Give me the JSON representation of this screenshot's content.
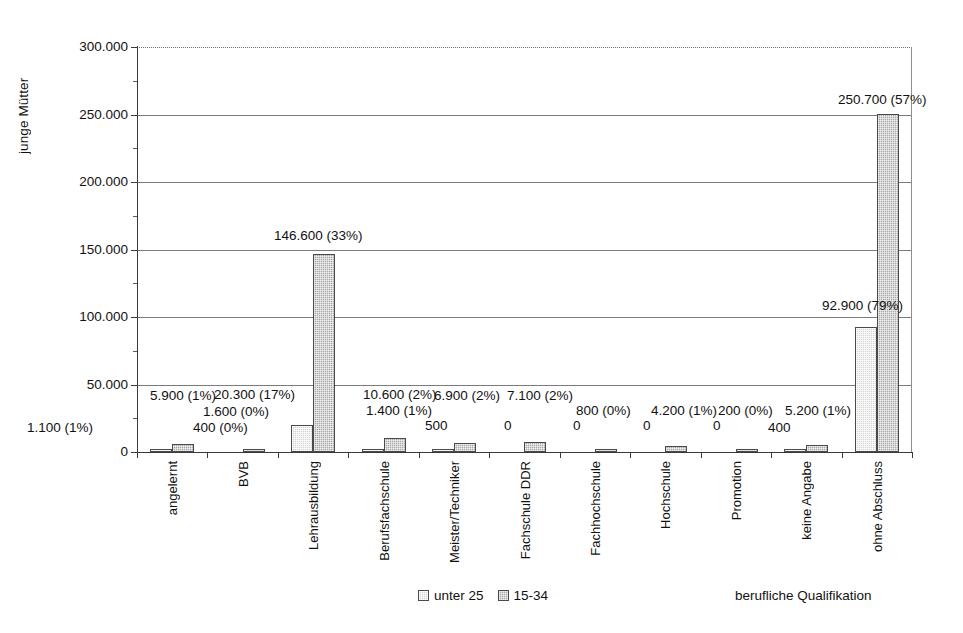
{
  "chart_data": {
    "type": "bar",
    "title": "",
    "xlabel": "berufliche Qualifikation",
    "ylabel": "junge Mütter",
    "ylim": [
      0,
      300000
    ],
    "ytick_step": 50000,
    "yminor_step": 25000,
    "grid": true,
    "legend_position": "bottom-center",
    "ytick_labels": [
      "0",
      "50.000",
      "100.000",
      "150.000",
      "200.000",
      "250.000",
      "300.000"
    ],
    "ytick_values": [
      0,
      50000,
      100000,
      150000,
      200000,
      250000,
      300000
    ],
    "categories": [
      "angelernt",
      "BVB",
      "Lehrausbildung",
      "Berufsfachschule",
      "Meister/Techniker",
      "Fachschule DDR",
      "Fachhochschule",
      "Hochschule",
      "Promotion",
      "keine Angabe",
      "ohne Abschluss"
    ],
    "series": [
      {
        "name": "unter 25",
        "color": "#d2d2d2",
        "values": [
          1100,
          0,
          20300,
          1400,
          500,
          0,
          0,
          0,
          0,
          400,
          92900
        ],
        "labels": [
          "1.100 (1%)",
          "",
          "20.300 (17%)",
          "1.400 (1%)",
          "500",
          "0",
          "0",
          "0",
          "0",
          "400",
          "92.900 (79%)"
        ]
      },
      {
        "name": "15-34",
        "color": "#a8a8a8",
        "values": [
          5900,
          1600,
          146600,
          10600,
          6900,
          7100,
          800,
          4200,
          200,
          5200,
          250700
        ],
        "labels": [
          "5.900 (1%)",
          "1.600 (0%)",
          "146.600 (33%)",
          "10.600 (2%)",
          "6.900 (2%)",
          "7.100 (2%)",
          "800 (0%)",
          "4.200 (1%)",
          "200 (0%)",
          "5.200 (1%)",
          "250.700 (57%)"
        ]
      }
    ],
    "extra_labels": [
      {
        "text": "400 (0%)",
        "category": "BVB",
        "series": "unter 25",
        "value": 400
      }
    ]
  },
  "legend": {
    "entries": [
      {
        "label": "unter 25"
      },
      {
        "label": "15-34"
      }
    ]
  }
}
